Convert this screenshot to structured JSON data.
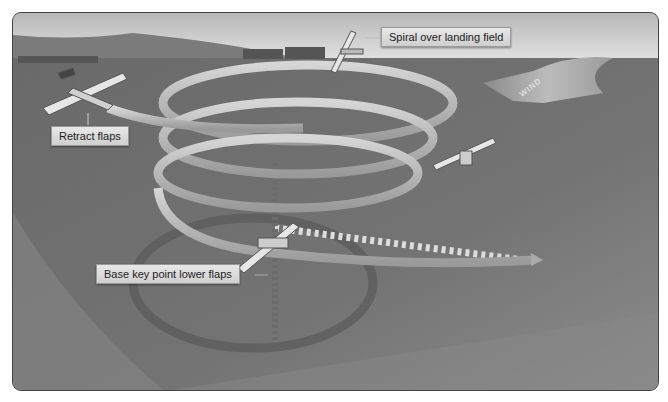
{
  "figure": {
    "callouts": {
      "spiral": "Spiral over landing field",
      "retract": "Retract flaps",
      "base_key": "Base key point lower flaps"
    },
    "wind_label": "WIND",
    "colors": {
      "sky": "#d9d9d9",
      "hills": "#7a7a7a",
      "ground": "#6f6f6f",
      "ground_light": "#8a8a8a",
      "path": "#bdbdbd",
      "path_edge": "#8e8e8e",
      "callout_bg": "#dcdcdc"
    }
  }
}
